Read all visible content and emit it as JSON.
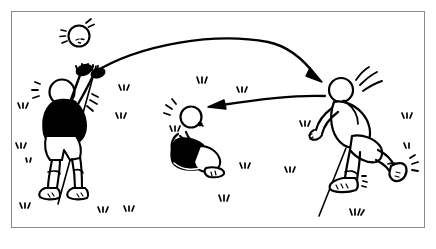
{
  "illustration": {
    "title": "Soccer drill diagram: throw-in, header and pass",
    "style": "black and white line drawing",
    "background_color": "#ffffff",
    "ink_color": "#000000",
    "frame": {
      "border_color": "#8a8a8a",
      "x": 11,
      "y": 11,
      "width": 414,
      "height": 217
    },
    "ball": {
      "label": "soccer-ball",
      "cx": 79,
      "cy": 36,
      "r": 11,
      "motion_marks": 4
    },
    "players": [
      {
        "id": "player-left",
        "label": "Player throwing in",
        "posture": "standing, both arms raised overhead",
        "shirt_color": "#000000",
        "shorts_color": "#ffffff",
        "x": 70,
        "y": 125
      },
      {
        "id": "player-center",
        "label": "Player crouching",
        "posture": "kneeling, arms forward",
        "shirt_color": "#000000",
        "shorts_color": "#000000",
        "x": 192,
        "y": 145
      },
      {
        "id": "player-right",
        "label": "Player heading the ball",
        "posture": "bent forward, leg extended back",
        "shirt_color": "#ffffff",
        "shorts_color": "#ffffff",
        "x": 352,
        "y": 125
      }
    ],
    "arrows": [
      {
        "id": "arrow-throw",
        "label": "Ball path from left player to right player",
        "direction": "right-down",
        "from": {
          "x": 93,
          "y": 73
        },
        "to": {
          "x": 322,
          "y": 82
        }
      },
      {
        "id": "arrow-pass",
        "label": "Pass path from right player to center player",
        "direction": "left",
        "from": {
          "x": 325,
          "y": 96
        },
        "to": {
          "x": 208,
          "y": 107
        }
      }
    ],
    "ground_lines": [
      {
        "id": "line-left",
        "x1": 96,
        "y1": 66,
        "x2": 58,
        "y2": 204
      },
      {
        "id": "line-right",
        "x1": 346,
        "y1": 148,
        "x2": 319,
        "y2": 216
      }
    ],
    "grass_tufts_count": 16
  }
}
